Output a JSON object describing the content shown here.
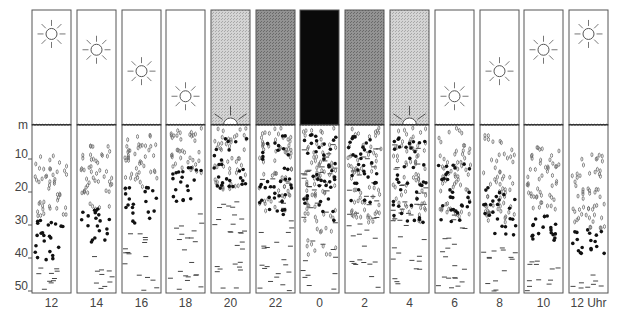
{
  "diagram": {
    "depth_axis": {
      "unit_label": "m",
      "ticks": [
        "10",
        "20",
        "30",
        "40",
        "50"
      ],
      "tick_values_m": [
        10,
        20,
        30,
        40,
        50
      ]
    },
    "columns": [
      {
        "time": "12",
        "sky": "day",
        "sun_height": 0.85,
        "zone_oval": [
          8,
          28
        ],
        "zone_dot": [
          28,
          42
        ],
        "zone_dash": [
          42,
          52
        ]
      },
      {
        "time": "14",
        "sky": "day",
        "sun_height": 0.68,
        "zone_oval": [
          5,
          26
        ],
        "zone_dot": [
          24,
          36
        ],
        "zone_dash": [
          38,
          52
        ]
      },
      {
        "time": "16",
        "sky": "day",
        "sun_height": 0.45,
        "zone_oval": [
          1,
          20
        ],
        "zone_dot": [
          18,
          30
        ],
        "zone_dash": [
          32,
          52
        ]
      },
      {
        "time": "18",
        "sky": "day",
        "sun_height": 0.18,
        "zone_oval": [
          0,
          15
        ],
        "zone_dot": [
          12,
          24
        ],
        "zone_dash": [
          26,
          52
        ]
      },
      {
        "time": "20",
        "sky": "dusk",
        "sun_height": 0.0,
        "zone_oval": [
          0,
          20
        ],
        "zone_dot": [
          3,
          20
        ],
        "zone_dash": [
          18,
          52
        ]
      },
      {
        "time": "22",
        "sky": "night-dim",
        "sun_height": null,
        "zone_oval": [
          0,
          28
        ],
        "zone_dot": [
          2,
          28
        ],
        "zone_dash": [
          15,
          52
        ]
      },
      {
        "time": "0",
        "sky": "night",
        "sun_height": null,
        "zone_oval": [
          0,
          40
        ],
        "zone_dot": [
          2,
          30
        ],
        "zone_dash": [
          5,
          52
        ]
      },
      {
        "time": "2",
        "sky": "night-dim",
        "sun_height": null,
        "zone_oval": [
          0,
          30
        ],
        "zone_dot": [
          2,
          24
        ],
        "zone_dash": [
          5,
          52
        ]
      },
      {
        "time": "4",
        "sky": "dawn",
        "sun_height": 0.0,
        "zone_oval": [
          0,
          30
        ],
        "zone_dot": [
          3,
          30
        ],
        "zone_dash": [
          5,
          52
        ]
      },
      {
        "time": "6",
        "sky": "day",
        "sun_height": 0.18,
        "zone_oval": [
          0,
          28
        ],
        "zone_dot": [
          10,
          30
        ],
        "zone_dash": [
          25,
          52
        ]
      },
      {
        "time": "8",
        "sky": "day",
        "sun_height": 0.45,
        "zone_oval": [
          2,
          30
        ],
        "zone_dot": [
          18,
          34
        ],
        "zone_dash": [
          35,
          52
        ]
      },
      {
        "time": "10",
        "sky": "day",
        "sun_height": 0.68,
        "zone_oval": [
          5,
          28
        ],
        "zone_dot": [
          26,
          36
        ],
        "zone_dash": [
          40,
          52
        ]
      },
      {
        "time": "12 Uhr",
        "sky": "day",
        "sun_height": 0.85,
        "zone_oval": [
          7,
          32
        ],
        "zone_dot": [
          30,
          40
        ],
        "zone_dash": [
          43,
          52
        ]
      }
    ],
    "legend_semantics": {
      "oval": "open oval organisms",
      "dot": "filled dot organisms",
      "dash": "dash-shaped organisms"
    },
    "colors": {
      "outline": "#555555",
      "day_sky": "#ffffff",
      "dusk_sky": "#c8c8c8",
      "night_dim_sky": "#8a8a8a",
      "night_sky": "#0a0a0a",
      "dot": "#111111",
      "oval": "#666666",
      "dash": "#444444"
    }
  }
}
